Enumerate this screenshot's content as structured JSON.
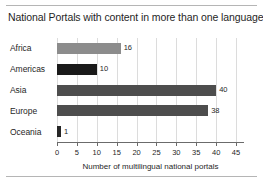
{
  "chart_data": {
    "type": "bar",
    "orientation": "horizontal",
    "title": "National Portals with content in more than one language",
    "categories": [
      "Africa",
      "Americas",
      "Asia",
      "Europe",
      "Oceania"
    ],
    "values": [
      16,
      10,
      40,
      38,
      1
    ],
    "value_labels": [
      "16",
      "10",
      "40",
      "38",
      "1"
    ],
    "bar_colors": [
      "#8c8c8c",
      "#1a1a1a",
      "#4d4d4d",
      "#4d4d4d",
      "#262626"
    ],
    "xlabel": "Number of multilingual national portals",
    "ylabel": "",
    "xlim": [
      0,
      47
    ],
    "xticks": [
      0,
      5,
      10,
      15,
      20,
      25,
      30,
      35,
      40,
      45
    ],
    "xtick_labels": [
      "0",
      "5",
      "10",
      "15",
      "20",
      "25",
      "30",
      "35",
      "40",
      "45"
    ],
    "grid": "vertical",
    "legend": "none",
    "axis_color": "#6b6b6b",
    "grid_color": "#dcdcdc",
    "rule_color": "#b5b5b5"
  }
}
